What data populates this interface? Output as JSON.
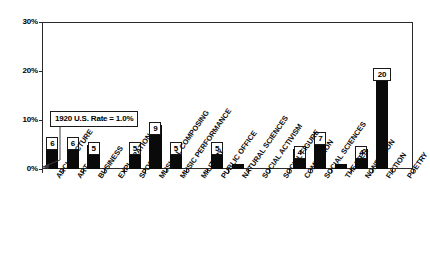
{
  "chart_data": {
    "type": "bar",
    "title": "",
    "xlabel": "",
    "ylabel": "",
    "ylim": [
      0,
      30
    ],
    "yticks": [
      0,
      10,
      20,
      30
    ],
    "ytick_labels": [
      "0%",
      "10%",
      "20%",
      "30%"
    ],
    "grid": false,
    "legend": "none",
    "categories": [
      "ARCHITECTURE",
      "ART",
      "BUSINESS",
      "EXPLORATION",
      "SPORTS",
      "MUSICAL COMPOSING",
      "MUSIC PERFORMANCE",
      "MILITARY",
      "PUBLIC OFFICE",
      "NATURAL SCIENCES",
      "SOCIAL ACTIVISM",
      "SOCIAL FIGURE",
      "COMPANION",
      "SOCIAL SCIENCES",
      "THEATER",
      "NONFICTION",
      "FICTION",
      "POETRY"
    ],
    "values": [
      6,
      6,
      5,
      0,
      5,
      9,
      5,
      0,
      5,
      1,
      0,
      0,
      4,
      7,
      1,
      4,
      20,
      0
    ],
    "value_labels": [
      "6",
      "6",
      "5",
      "",
      "5",
      "9",
      "5",
      "",
      "5",
      "",
      "",
      "",
      "4",
      "7",
      "",
      "4",
      "20",
      ""
    ],
    "annotations": [
      {
        "text": "1920 U.S. Rate = 1.0%",
        "points_to_value": 1.0
      }
    ],
    "bar_color": "#0a0a0a",
    "axis_color": "#2b2b2b"
  }
}
